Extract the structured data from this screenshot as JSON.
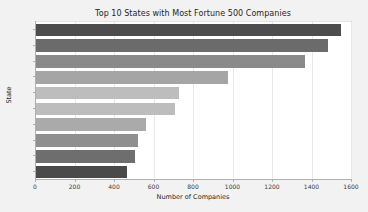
{
  "chart_data": {
    "type": "bar",
    "orientation": "horizontal",
    "title": "Top 10 States with Most Fortune 500 Companies",
    "xlabel": "Number of Companies",
    "ylabel": "State",
    "categories": [
      "NY",
      "CA",
      "TX",
      "IL",
      "OH",
      "PA",
      "NJ",
      "VA",
      "MI",
      "MN"
    ],
    "values": [
      1549,
      1484,
      1367,
      977,
      729,
      709,
      562,
      521,
      506,
      466
    ],
    "xlim": [
      0,
      1600
    ],
    "ylim": [
      -0.5,
      9.5
    ],
    "xticks": [
      0,
      200,
      400,
      600,
      800,
      1000,
      1200,
      1400,
      1600
    ],
    "xticklabels": [
      "0",
      "200",
      "400",
      "600",
      "800",
      "1000",
      "1200",
      "1400",
      "1600"
    ],
    "grid": "x-only",
    "legend": "none",
    "bar_colors": [
      "#4d4d4d",
      "#6b6b6b",
      "#8a8a8a",
      "#a5a5a5",
      "#bdbdbd",
      "#bdbdbd",
      "#aaaaaa",
      "#8f8f8f",
      "#6e6e6e",
      "#4a4a4a"
    ],
    "figure_background": "#f2f2f2",
    "plot_background": "#ffffff",
    "gridline_color": "#e8e8e8",
    "axis_color": "#b0b0b0",
    "text_color": "#262626"
  }
}
